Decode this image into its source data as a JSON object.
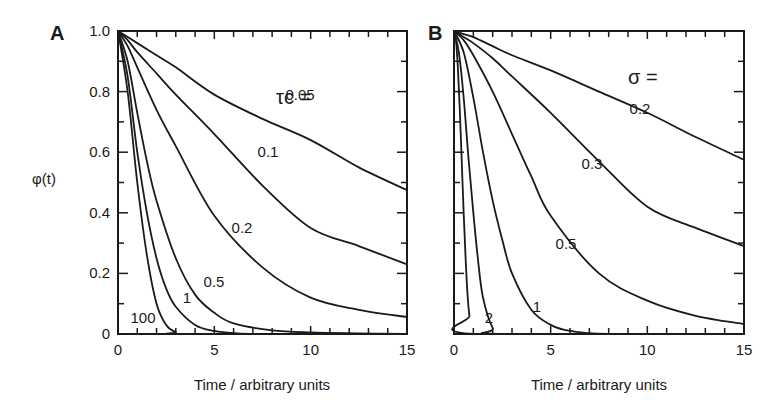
{
  "figure": {
    "ylabel": "φ(t)"
  },
  "chart_data": [
    {
      "panel": "A",
      "type": "line",
      "title": "",
      "xlabel": "Time / arbitrary units",
      "ylabel": "φ(t)",
      "xlim": [
        0,
        15
      ],
      "ylim": [
        0,
        1.0
      ],
      "xticks": [
        "0",
        "5",
        "10",
        "15"
      ],
      "yticks": [
        "0",
        "0.2",
        "0.4",
        "0.6",
        "0.8",
        "1.0"
      ],
      "grid": false,
      "legend_title": "τc =",
      "series": [
        {
          "name": "0.05",
          "x": [
            0,
            0.5,
            1,
            2,
            3,
            5,
            7.5,
            10,
            12.5,
            15
          ],
          "y": [
            1.0,
            0.98,
            0.96,
            0.92,
            0.88,
            0.79,
            0.71,
            0.64,
            0.55,
            0.475
          ],
          "label_pos": [
            300,
            95
          ]
        },
        {
          "name": "0.1",
          "x": [
            0,
            0.5,
            1,
            2,
            3,
            5,
            7.5,
            10,
            12.5,
            15
          ],
          "y": [
            1.0,
            0.97,
            0.93,
            0.86,
            0.79,
            0.66,
            0.49,
            0.35,
            0.29,
            0.23
          ],
          "label_pos": [
            268,
            152
          ]
        },
        {
          "name": "0.2",
          "x": [
            0,
            0.5,
            1,
            2,
            3,
            5,
            7.5,
            10,
            12.5,
            15
          ],
          "y": [
            1.0,
            0.95,
            0.88,
            0.74,
            0.62,
            0.39,
            0.22,
            0.12,
            0.08,
            0.056
          ],
          "label_pos": [
            242,
            228
          ]
        },
        {
          "name": "0.5",
          "x": [
            0,
            0.5,
            1,
            1.5,
            2,
            3,
            4,
            5,
            6,
            8,
            10,
            12.5,
            15
          ],
          "y": [
            1.0,
            0.9,
            0.73,
            0.57,
            0.44,
            0.25,
            0.13,
            0.07,
            0.035,
            0.012,
            0.005,
            0.002,
            0.0
          ],
          "label_pos": [
            214,
            282
          ]
        },
        {
          "name": "1",
          "x": [
            0,
            0.5,
            1,
            1.5,
            2,
            2.5,
            3,
            4,
            5,
            6,
            8,
            15
          ],
          "y": [
            1.0,
            0.85,
            0.6,
            0.4,
            0.25,
            0.15,
            0.09,
            0.03,
            0.01,
            0.003,
            0.0,
            0.0
          ],
          "label_pos": [
            187,
            298
          ]
        },
        {
          "name": "100",
          "x": [
            0,
            0.5,
            1,
            1.5,
            2,
            2.5,
            3,
            3.5,
            15
          ],
          "y": [
            1.0,
            0.8,
            0.5,
            0.26,
            0.1,
            0.03,
            0.006,
            0.0,
            0.0
          ],
          "label_pos": [
            143,
            318
          ]
        }
      ]
    },
    {
      "panel": "B",
      "type": "line",
      "title": "",
      "xlabel": "Time / arbitrary units",
      "ylabel": "",
      "xlim": [
        0,
        15
      ],
      "ylim": [
        0,
        1.0
      ],
      "xticks": [
        "0",
        "5",
        "10",
        "15"
      ],
      "yticks": [],
      "grid": false,
      "legend_title": "σ =",
      "series": [
        {
          "name": "0.2",
          "x": [
            0,
            0.5,
            1,
            2,
            3,
            5,
            7.5,
            10,
            12.5,
            15
          ],
          "y": [
            1.0,
            0.99,
            0.98,
            0.95,
            0.92,
            0.87,
            0.8,
            0.73,
            0.65,
            0.575
          ],
          "label_pos": [
            640,
            109
          ]
        },
        {
          "name": "0.3",
          "x": [
            0,
            0.5,
            1,
            2,
            3,
            5,
            7.5,
            10,
            12.5,
            15
          ],
          "y": [
            1.0,
            0.98,
            0.96,
            0.91,
            0.85,
            0.73,
            0.57,
            0.42,
            0.35,
            0.29
          ],
          "label_pos": [
            592,
            164
          ]
        },
        {
          "name": "0.5",
          "x": [
            0,
            0.5,
            1,
            2,
            3,
            4,
            5,
            7.5,
            10,
            12.5,
            15
          ],
          "y": [
            1.0,
            0.97,
            0.92,
            0.8,
            0.66,
            0.52,
            0.39,
            0.2,
            0.11,
            0.06,
            0.033
          ],
          "label_pos": [
            566,
            244
          ]
        },
        {
          "name": "1",
          "x": [
            0,
            0.5,
            1,
            1.5,
            2,
            2.5,
            3,
            4,
            5,
            6,
            8,
            15
          ],
          "y": [
            1.0,
            0.93,
            0.78,
            0.6,
            0.44,
            0.31,
            0.2,
            0.08,
            0.03,
            0.01,
            0.0,
            0.0
          ],
          "label_pos": [
            537,
            307
          ]
        },
        {
          "name": "2",
          "x": [
            0,
            0.25,
            0.5,
            0.75,
            1,
            1.25,
            1.5,
            2,
            2.5,
            15
          ],
          "y": [
            1.0,
            0.93,
            0.78,
            0.58,
            0.4,
            0.24,
            0.12,
            0.02,
            0.0,
            0.0
          ],
          "label_pos": [
            489,
            318
          ]
        },
        {
          "name": "",
          "x": [
            0,
            0.1,
            0.2,
            0.3,
            0.4,
            0.5,
            0.6,
            0.7,
            0.8,
            1.0,
            15
          ],
          "y": [
            1.0,
            0.97,
            0.88,
            0.74,
            0.57,
            0.4,
            0.25,
            0.13,
            0.06,
            0.0,
            0.0
          ],
          "label_pos": null
        }
      ]
    }
  ]
}
